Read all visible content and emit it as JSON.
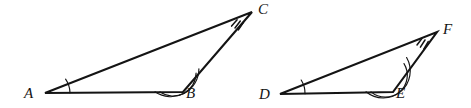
{
  "figure": {
    "background_color": "#ffffff",
    "stroke_color": "#141414",
    "label_color": "#141414",
    "width": 471,
    "height": 108
  },
  "triangles": [
    {
      "id": "triangle-abc",
      "name": "Triangle ABC",
      "vertices": [
        {
          "label": "A",
          "x": 45,
          "y": 93,
          "label_x": 24,
          "label_y": 86,
          "marking": "single-arc",
          "arc_count": 1
        },
        {
          "label": "B",
          "x": 183,
          "y": 92,
          "label_x": 186,
          "label_y": 86,
          "marking": "double-arc",
          "arc_count": 2
        },
        {
          "label": "C",
          "x": 252,
          "y": 12,
          "label_x": 258,
          "label_y": 2,
          "marking": "triple-tick",
          "arc_count": 3
        }
      ],
      "edges": [
        {
          "from": "A",
          "to": "B",
          "name": "side-ab"
        },
        {
          "from": "B",
          "to": "C",
          "name": "side-bc"
        },
        {
          "from": "C",
          "to": "A",
          "name": "side-ca"
        }
      ]
    },
    {
      "id": "triangle-def",
      "name": "Triangle DEF",
      "vertices": [
        {
          "label": "D",
          "x": 280,
          "y": 94,
          "label_x": 259,
          "label_y": 87,
          "marking": "single-arc",
          "arc_count": 1
        },
        {
          "label": "E",
          "x": 393,
          "y": 92,
          "label_x": 396,
          "label_y": 86,
          "marking": "double-arc",
          "arc_count": 2
        },
        {
          "label": "F",
          "x": 437,
          "y": 32,
          "label_x": 443,
          "label_y": 22,
          "marking": "triple-tick",
          "arc_count": 3
        }
      ],
      "edges": [
        {
          "from": "D",
          "to": "E",
          "name": "side-de"
        },
        {
          "from": "E",
          "to": "F",
          "name": "side-ef"
        },
        {
          "from": "F",
          "to": "D",
          "name": "side-fd"
        }
      ]
    }
  ],
  "geometry_paths": {
    "triangle_abc_outline": "M 45 93 L 183 92 L 252 12 Z",
    "triangle_def_outline": "M 280 94 L 393 92 L 437 32 Z",
    "angle_a_arc": "M 70 92.8 A 25 25 0 0 0 65.6 79.2",
    "angle_b_arc_inner": "M 160 91.9 A 23 23 0 0 0 196.1 73.0",
    "angle_b_arc_outer": "M 155 91.8 A 28 28 0 0 0 198.9 68.7",
    "angle_c_tick_1": "M 231.6 26.1 L 237.1 19.7",
    "angle_c_tick_2": "M 235.0 28.0 L 240.3 21.0",
    "angle_c_tick_3": "M 238.4 29.9 L 243.5 22.3",
    "angle_d_arc": "M 305 93.8 A 25 25 0 0 0 301.2 80.0",
    "angle_e_arc_inner": "M 371 91.9 A 22 22 0 0 0 404.0 63.6",
    "angle_e_arc_outer": "M 366 91.8 A 27 27 0 0 0 406.6 57.5",
    "angle_f_tick_1": "M 417.0 45.0 L 421.9 38.5",
    "angle_f_tick_2": "M 420.4 47.1 L 425.0 40.0",
    "angle_f_tick_3": "M 423.8 49.2 L 428.2 41.5"
  },
  "stroke_widths": {
    "triangle_side": 2.1,
    "angle_arc": 1.15,
    "angle_tick": 1.5
  }
}
